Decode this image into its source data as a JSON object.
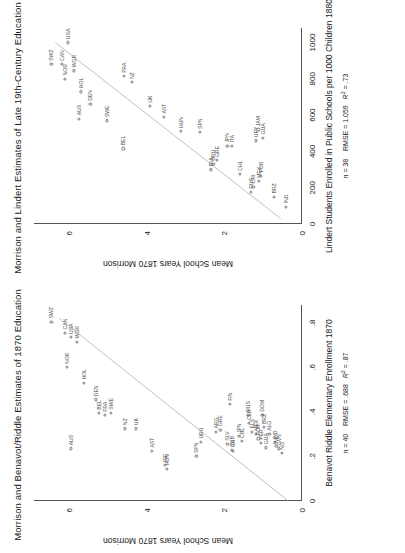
{
  "figure": {
    "orientation": "rotated-90-ccw",
    "panel_count": 2,
    "marker_color": "#7a7a7a",
    "label_color": "#4d4d4d",
    "axis_color": "#555555",
    "fit_line_color": "#b9b9b9"
  },
  "chart_data": [
    {
      "id": "panel-left",
      "type": "scatter",
      "title": "Morrison and Benavot/Riddle Estimates of 1870 Education",
      "xlabel": "Benavot Riddle Elementary Enrollment 1870",
      "ylabel": "Mean School Years 1870 Morrison",
      "xlim": [
        0,
        0.88
      ],
      "ylim": [
        0,
        6.9
      ],
      "xticks": [
        0,
        0.2,
        0.4,
        0.6,
        0.8
      ],
      "xticklabels": [
        "0",
        ".2",
        ".4",
        ".6",
        ".8"
      ],
      "yticks": [
        0,
        2,
        4,
        6
      ],
      "yticklabels": [
        "0",
        "2",
        "4",
        "6"
      ],
      "grid": false,
      "legend": false,
      "annotation": "n = 40   RMSE = .688  R² = .87",
      "stats": {
        "n": 40,
        "rmse": ".688",
        "r2": ".87"
      },
      "fit_line": {
        "x": [
          0.0,
          0.82
        ],
        "y": [
          0.35,
          6.25
        ]
      },
      "points": [
        {
          "label": "SWZ",
          "x": 0.805,
          "y": 6.45
        },
        {
          "label": "CAN",
          "x": 0.755,
          "y": 6.1
        },
        {
          "label": "USA",
          "x": 0.735,
          "y": 5.95
        },
        {
          "label": "WGR",
          "x": 0.715,
          "y": 5.8
        },
        {
          "label": "NOR",
          "x": 0.6,
          "y": 6.05
        },
        {
          "label": "HOL",
          "x": 0.53,
          "y": 5.62
        },
        {
          "label": "DEN",
          "x": 0.455,
          "y": 5.3
        },
        {
          "label": "SWE",
          "x": 0.395,
          "y": 4.92
        },
        {
          "label": "BEL",
          "x": 0.395,
          "y": 5.22
        },
        {
          "label": "FRA",
          "x": 0.385,
          "y": 5.08
        },
        {
          "label": "AUS",
          "x": 0.235,
          "y": 5.95
        },
        {
          "label": "NZ",
          "x": 0.325,
          "y": 4.55
        },
        {
          "label": "UK",
          "x": 0.325,
          "y": 4.28
        },
        {
          "label": "AST",
          "x": 0.225,
          "y": 3.86
        },
        {
          "label": "IRE",
          "x": 0.16,
          "y": 3.52
        },
        {
          "label": "HUN",
          "x": 0.145,
          "y": 3.48
        },
        {
          "label": "FIN",
          "x": 0.435,
          "y": 1.85
        },
        {
          "label": "URU",
          "x": 0.265,
          "y": 2.6
        },
        {
          "label": "SPN",
          "x": 0.2,
          "y": 2.72
        },
        {
          "label": "ARG",
          "x": 0.31,
          "y": 2.22
        },
        {
          "label": "GRE",
          "x": 0.32,
          "y": 2.1
        },
        {
          "label": "SLV",
          "x": 0.255,
          "y": 1.92
        },
        {
          "label": "ITA",
          "x": 0.225,
          "y": 1.78
        },
        {
          "label": "CUB",
          "x": 0.228,
          "y": 1.8
        },
        {
          "label": "JPN",
          "x": 0.29,
          "y": 1.62
        },
        {
          "label": "CHL",
          "x": 0.268,
          "y": 1.55
        },
        {
          "label": "RUS",
          "x": 0.385,
          "y": 1.38
        },
        {
          "label": "CLB",
          "x": 0.35,
          "y": 1.36
        },
        {
          "label": "ELS",
          "x": 0.31,
          "y": 1.28
        },
        {
          "label": "DOM",
          "x": 0.385,
          "y": 1.02
        },
        {
          "label": "BRZ",
          "x": 0.33,
          "y": 0.98
        },
        {
          "label": "ALG",
          "x": 0.3,
          "y": 0.84
        },
        {
          "label": "IND",
          "x": 0.262,
          "y": 0.7
        },
        {
          "label": "NIC",
          "x": 0.245,
          "y": 0.66
        },
        {
          "label": "GVN",
          "x": 0.235,
          "y": 0.6
        },
        {
          "label": "NG",
          "x": 0.215,
          "y": 0.52
        },
        {
          "label": "MEX",
          "x": 0.3,
          "y": 1.18
        },
        {
          "label": "POR",
          "x": 0.28,
          "y": 1.12
        },
        {
          "label": "PER",
          "x": 0.26,
          "y": 1.06
        },
        {
          "label": "GUA",
          "x": 0.24,
          "y": 0.92
        }
      ]
    },
    {
      "id": "panel-right",
      "type": "scatter",
      "title": "Morrison and Lindert Estimates of Late 19th-Century Education",
      "xlabel": "Lindert Students Enrolled in Public Schools per 1000 Children 1880",
      "ylabel": "Mean School Years 1870 Morrison",
      "xlim": [
        0,
        1080
      ],
      "ylim": [
        0,
        6.9
      ],
      "xticks": [
        0,
        200,
        400,
        600,
        800,
        1000
      ],
      "xticklabels": [
        "0",
        "200",
        "400",
        "600",
        "800",
        "1000"
      ],
      "yticks": [
        0,
        2,
        4,
        6
      ],
      "yticklabels": [
        "0",
        "2",
        "4",
        "6"
      ],
      "grid": false,
      "legend": false,
      "annotation": "n = 38   RMSE = 1.059  R² = .73",
      "stats": {
        "n": 38,
        "rmse": "1.059",
        "r2": ".73"
      },
      "fit_line": {
        "x": [
          30,
          1000
        ],
        "y": [
          0.55,
          6.35
        ]
      },
      "points": [
        {
          "label": "SWZ",
          "x": 880,
          "y": 6.45
        },
        {
          "label": "USA",
          "x": 1000,
          "y": 6.02
        },
        {
          "label": "CAN",
          "x": 880,
          "y": 6.18
        },
        {
          "label": "WGR",
          "x": 845,
          "y": 5.88
        },
        {
          "label": "NOR",
          "x": 800,
          "y": 6.1
        },
        {
          "label": "HOL",
          "x": 730,
          "y": 5.7
        },
        {
          "label": "DEN",
          "x": 660,
          "y": 5.45
        },
        {
          "label": "SWE",
          "x": 570,
          "y": 5.02
        },
        {
          "label": "FRA",
          "x": 815,
          "y": 4.58
        },
        {
          "label": "NZ",
          "x": 780,
          "y": 4.38
        },
        {
          "label": "AUS",
          "x": 580,
          "y": 5.75
        },
        {
          "label": "UK",
          "x": 650,
          "y": 3.92
        },
        {
          "label": "AST",
          "x": 590,
          "y": 3.56
        },
        {
          "label": "HUN",
          "x": 510,
          "y": 3.12
        },
        {
          "label": "BEL",
          "x": 415,
          "y": 4.6
        },
        {
          "label": "SPN",
          "x": 505,
          "y": 2.62
        },
        {
          "label": "BUL",
          "x": 300,
          "y": 2.35
        },
        {
          "label": "URU",
          "x": 330,
          "y": 2.28
        },
        {
          "label": "GRE",
          "x": 350,
          "y": 2.2
        },
        {
          "label": "JPN",
          "x": 430,
          "y": 1.92
        },
        {
          "label": "ITA",
          "x": 430,
          "y": 1.8
        },
        {
          "label": "CHL",
          "x": 275,
          "y": 1.6
        },
        {
          "label": "RUS",
          "x": 175,
          "y": 1.32
        },
        {
          "label": "CRI",
          "x": 205,
          "y": 1.25
        },
        {
          "label": "MEX",
          "x": 235,
          "y": 1.1
        },
        {
          "label": "POR",
          "x": 265,
          "y": 1.05
        },
        {
          "label": "URY",
          "x": 460,
          "y": 1.18
        },
        {
          "label": "GUA",
          "x": 475,
          "y": 1.0
        },
        {
          "label": "JAM",
          "x": 520,
          "y": 1.12
        },
        {
          "label": "BRZ",
          "x": 150,
          "y": 0.72
        },
        {
          "label": "IND",
          "x": 95,
          "y": 0.42
        }
      ]
    }
  ]
}
